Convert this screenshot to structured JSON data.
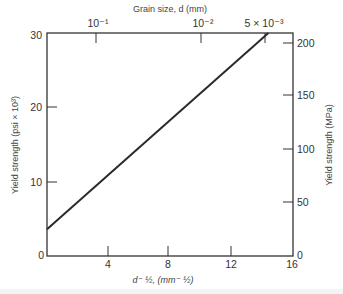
{
  "chart_data": {
    "type": "line",
    "title": "",
    "top_axis": {
      "label": "Grain size, d (mm)",
      "ticks": [
        {
          "label": "10⁻¹",
          "x": 3.16
        },
        {
          "label": "10⁻²",
          "x": 10.0
        },
        {
          "label": "5 × 10⁻³",
          "x": 14.14
        }
      ]
    },
    "xlabel": "d⁻½, (mm⁻½)",
    "ylabel": "Yield strength (psi × 10³)",
    "y2label": "Yield strength (MPa)",
    "xlim": [
      0,
      16
    ],
    "ylim": [
      0,
      30
    ],
    "y2lim": [
      0,
      206.8
    ],
    "xticks": [
      0,
      4,
      8,
      12,
      16
    ],
    "xtick_labels": [
      "4",
      "8",
      "12",
      "16"
    ],
    "yticks": [
      0,
      10,
      20,
      30
    ],
    "ytick_labels": [
      "0",
      "10",
      "20",
      "30"
    ],
    "y2ticks": [
      0,
      50,
      100,
      150,
      200
    ],
    "y2tick_labels": [
      "0",
      "50",
      "100",
      "150",
      "200"
    ],
    "grid": false,
    "legend": null,
    "series": [
      {
        "name": "Yield strength vs d^-1/2 (Hall-Petch)",
        "x": [
          0,
          14.4
        ],
        "y": [
          3.6,
          30
        ]
      }
    ],
    "color": "#2a2a2a"
  },
  "labels": {
    "top_axis_title": "Grain size, d (mm)",
    "top_tick_1": "10⁻¹",
    "top_tick_2": "10⁻²",
    "top_tick_3": "5 × 10⁻³",
    "left_axis_title": "Yield strength (psi × 10³)",
    "right_axis_title": "Yield strength (MPa)",
    "bottom_axis_title": "d⁻ ½, (mm⁻ ½)",
    "left_ticks": [
      "30",
      "20",
      "10",
      "0"
    ],
    "right_ticks": [
      "200",
      "150",
      "100",
      "50",
      "0"
    ],
    "bottom_ticks": [
      "4",
      "8",
      "12",
      "16"
    ]
  }
}
